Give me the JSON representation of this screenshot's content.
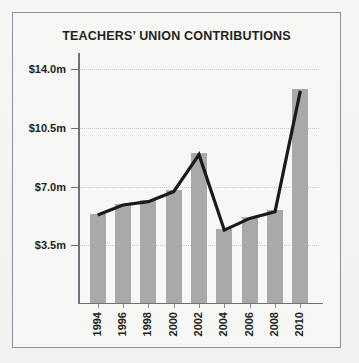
{
  "chart_data": {
    "type": "bar",
    "title": "TEACHERS’ UNION CONTRIBUTIONS",
    "xlabel": "",
    "ylabel": "",
    "categories": [
      "1994",
      "1996",
      "1998",
      "2000",
      "2002",
      "2004",
      "2006",
      "2008",
      "2010"
    ],
    "values": [
      5.3,
      5.9,
      6.1,
      6.7,
      8.9,
      4.4,
      5.1,
      5.5,
      12.7
    ],
    "series": [
      {
        "name": "Contributions (bars)",
        "type": "bar",
        "values": [
          5.3,
          5.9,
          6.1,
          6.7,
          8.9,
          4.4,
          5.1,
          5.5,
          12.7
        ]
      },
      {
        "name": "Contributions (trend line)",
        "type": "line",
        "values": [
          5.3,
          5.9,
          6.1,
          6.7,
          8.9,
          4.4,
          5.1,
          5.5,
          12.7
        ]
      }
    ],
    "ylim": [
      0,
      14.6
    ],
    "yticks": [
      3.5,
      7.0,
      10.5,
      14.0
    ],
    "ytick_labels": [
      "$3.5m",
      "$7.0m",
      "$10.5m",
      "$14.0m"
    ],
    "xtick_labels": [
      "1994",
      "1996",
      "1998",
      "2000",
      "2002",
      "2004",
      "2006",
      "2008",
      "2010"
    ],
    "grid": true,
    "legend": false,
    "colors": {
      "bar": "#a9a9a7",
      "line": "#1a1a1a",
      "axis": "#6f7277",
      "grid": "#c9c9c5",
      "text": "#231f20",
      "background": "#f7f7f5",
      "frame": "#8e9196"
    }
  }
}
